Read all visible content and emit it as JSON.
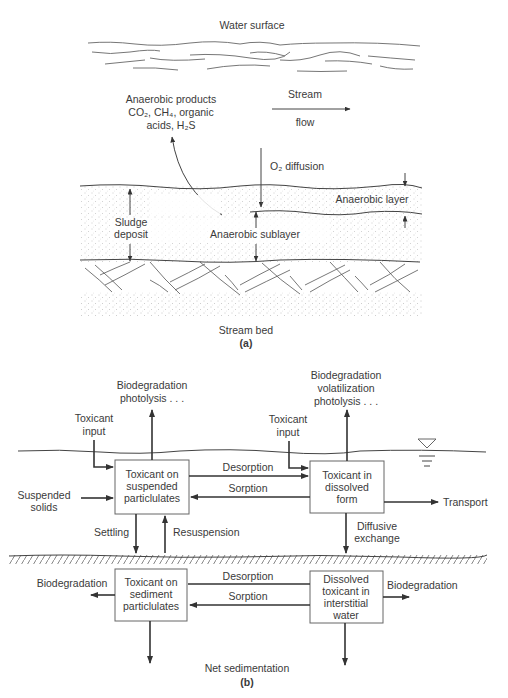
{
  "panel_a": {
    "water_surface": "Water surface",
    "anaerobic_products": [
      "Anaerobic products",
      "CO₂, CH₄, organic",
      "acids, H₂S"
    ],
    "stream_flow": [
      "Stream",
      "flow"
    ],
    "o2_diffusion": "O₂ diffusion",
    "anaerobic_layer": "Anaerobic layer",
    "sludge_deposit": [
      "Sludge",
      "deposit"
    ],
    "anaerobic_sublayer": "Anaerobic sublayer",
    "stream_bed": "Stream bed",
    "caption": "(a)"
  },
  "panel_b": {
    "top_left_process": [
      "Biodegradation",
      "photolysis . . ."
    ],
    "top_right_process": [
      "Biodegradation",
      "volatilization",
      "photolysis . . ."
    ],
    "toxicant_input_left": [
      "Toxicant",
      "input"
    ],
    "toxicant_input_right": [
      "Toxicant",
      "input"
    ],
    "box_suspended": [
      "Toxicant on",
      "suspended",
      "particlulates"
    ],
    "box_dissolved": [
      "Toxicant in",
      "dissolved",
      "form"
    ],
    "box_sediment": [
      "Toxicant on",
      "sediment",
      "particlulates"
    ],
    "box_interstitial": [
      "Dissolved",
      "toxicant in",
      "interstitial",
      "water"
    ],
    "desorption_upper": "Desorption",
    "sorption_upper": "Sorption",
    "desorption_lower": "Desorption",
    "sorption_lower": "Sorption",
    "suspended_solids": [
      "Suspended",
      "solids"
    ],
    "transport": "Transport",
    "settling": "Settling",
    "resuspension": "Resuspension",
    "diffusive_exchange": [
      "Diffusive",
      "exchange"
    ],
    "biodegradation_left": "Biodegradation",
    "biodegradation_right": "Biodegradation",
    "net_sedimentation": "Net sedimentation",
    "caption": "(b)"
  }
}
